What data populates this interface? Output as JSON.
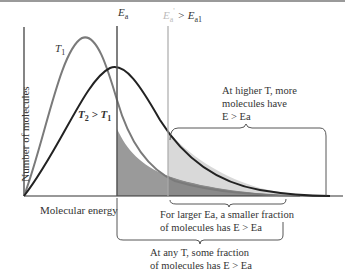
{
  "diagram": {
    "type": "Maxwell-Boltzmann energy distribution",
    "axes": {
      "ylabel": "Number of molecules",
      "xlabel": "Molecular energy"
    },
    "curves": [
      {
        "name": "T1",
        "label": "T",
        "sub": "1",
        "color": "#7a7a7a"
      },
      {
        "name": "T2",
        "label": "T",
        "sub": "2",
        "compare": " > T",
        "compare_sub": "1",
        "color": "#222222"
      }
    ],
    "thresholds": [
      {
        "name": "Ea",
        "label": "E",
        "sub": "a",
        "color": "#555555"
      },
      {
        "name": "Ea2",
        "label": "E",
        "sub": "a",
        "sup": "'",
        "compare": " > E",
        "compare_sub": "a1",
        "color": "#aaaaaa"
      }
    ],
    "annotations": {
      "higher_T": [
        "At higher T, more",
        "molecules have",
        "E > Ea"
      ],
      "larger_Ea": [
        "For larger Ea, a smaller fraction",
        "of molecules has E > Ea"
      ],
      "any_T": [
        "At any T, some fraction",
        "of molecules has E > Ea"
      ]
    },
    "colors": {
      "shade_dark": "#9a9a9a",
      "shade_light": "#d9d9d9",
      "axis": "#333333"
    }
  }
}
